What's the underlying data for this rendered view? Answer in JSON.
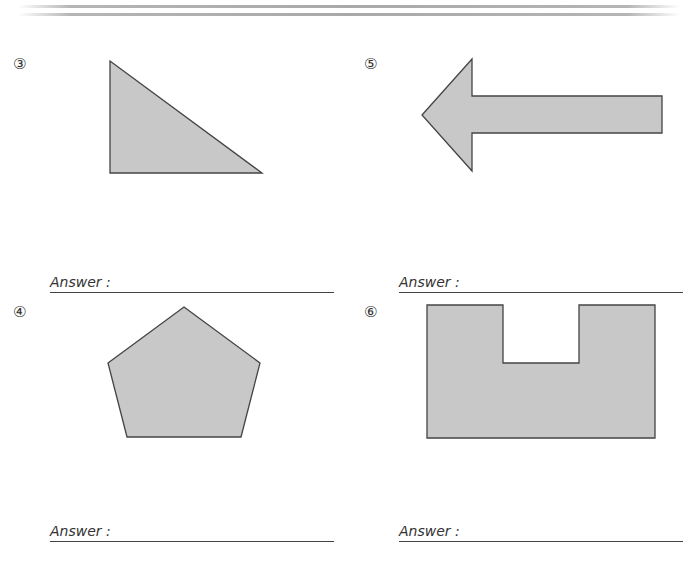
{
  "header": {
    "decoration": "double-horizontal-rule"
  },
  "problems": [
    {
      "number": "③",
      "shape": "right-triangle",
      "answer_label": "Answer :",
      "answer_value": ""
    },
    {
      "number": "⑤",
      "shape": "left-arrow",
      "answer_label": "Answer :",
      "answer_value": ""
    },
    {
      "number": "④",
      "shape": "pentagon",
      "answer_label": "Answer :",
      "answer_value": ""
    },
    {
      "number": "⑥",
      "shape": "u-shape-polygon",
      "answer_label": "Answer :",
      "answer_value": ""
    }
  ],
  "colors": {
    "shape_fill": "#c8c8c8",
    "shape_stroke": "#444444",
    "rule": "#aaaaaa"
  }
}
